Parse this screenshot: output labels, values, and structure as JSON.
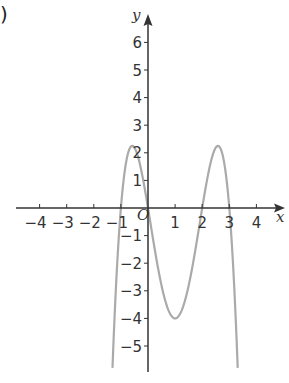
{
  "part_label": ")",
  "chart_data": {
    "type": "line",
    "title": "",
    "xlabel": "x",
    "ylabel": "y",
    "origin_label": "O",
    "xlim": [
      -4.5,
      5
    ],
    "ylim": [
      -6,
      6.5
    ],
    "x_ticks": [
      -4,
      -3,
      -2,
      -1,
      1,
      2,
      3,
      4
    ],
    "x_tick_labels": [
      "−4",
      "−3",
      "−2",
      "−1",
      "1",
      "2",
      "3",
      "4"
    ],
    "y_ticks": [
      6,
      5,
      4,
      3,
      2,
      1,
      -1,
      -2,
      -3,
      -4,
      -5
    ],
    "y_tick_labels": [
      "6",
      "5",
      "4",
      "3",
      "2",
      "1",
      "−1",
      "−2",
      "−3",
      "−4",
      "−5"
    ],
    "grid": false,
    "legend": null,
    "series": [
      {
        "name": "y = -x(x+1)(x-2)(x-3)",
        "roots": [
          -1,
          0,
          2,
          3
        ],
        "leading_coefficient": -1,
        "x_range": [
          -1.31,
          3.31
        ],
        "color": "#aaaaaa",
        "key_points": [
          {
            "x": -1,
            "y": 0
          },
          {
            "x": -0.5,
            "y": 2.19
          },
          {
            "x": 0,
            "y": 0
          },
          {
            "x": 1,
            "y": -4
          },
          {
            "x": 2,
            "y": 0
          },
          {
            "x": 2.5,
            "y": 2.19
          },
          {
            "x": 3,
            "y": 0
          }
        ]
      }
    ]
  },
  "colors": {
    "axis": "#333333",
    "curve": "#aaaaaa",
    "text": "#333333"
  }
}
